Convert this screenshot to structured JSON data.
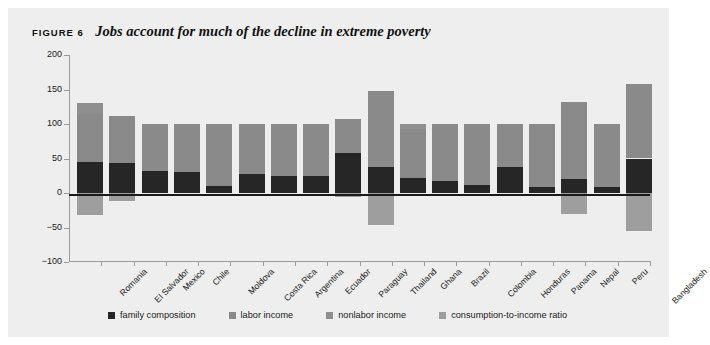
{
  "figure": {
    "label": "FIGURE 6",
    "caption": "Jobs account for much of the decline in extreme poverty"
  },
  "colors": {
    "panel_background": "#eeeeee",
    "family_composition": "#262626",
    "labor_income": "#7f7f7f",
    "nonlabor_income": "#8c8c8c",
    "consumption_to_income_ratio": "#a6a6a6",
    "axis": "#9a9a9a",
    "zero_line": "#1a1a1a"
  },
  "legend": {
    "position": "bottom",
    "items": [
      {
        "label": "family composition",
        "color": "#262626"
      },
      {
        "label": "labor income",
        "color": "#8a8a8a"
      },
      {
        "label": "nonlabor income",
        "color": "#8f8f8f"
      },
      {
        "label": "consumption-to-income ratio",
        "color": "#9e9e9e"
      }
    ]
  },
  "chart_data": {
    "type": "bar",
    "subtype": "stacked-bar-with-negatives",
    "title": "Jobs account for much of the decline in extreme poverty",
    "subtitle": "",
    "xlabel": "",
    "ylabel": "percentage of total change in extreme poverty",
    "ylim": [
      -100,
      200
    ],
    "yticks": [
      -100,
      -50,
      0,
      50,
      100,
      150,
      200
    ],
    "ytick_labels": [
      "−100",
      "−50",
      "0",
      "50",
      "100",
      "150",
      "200"
    ],
    "grid": false,
    "zero_reference_line": 0,
    "categories": [
      "Romania",
      "El Salvador",
      "Mexico",
      "Chile",
      "Moldova",
      "Costa Rica",
      "Argentina",
      "Ecuador",
      "Paraguay",
      "Thailand",
      "Ghana",
      "Brazil",
      "Colombia",
      "Honduras",
      "Panama",
      "Nepal",
      "Peru",
      "Bangladesh"
    ],
    "series": [
      {
        "name": "family composition",
        "color": "#262626",
        "values": [
          45,
          44,
          32,
          30,
          10,
          27,
          25,
          24,
          58,
          37,
          22,
          17,
          11,
          38,
          8,
          20,
          8,
          50
        ]
      },
      {
        "name": "labor income",
        "color": "#8a8a8a",
        "values": [
          70,
          67,
          68,
          70,
          90,
          73,
          75,
          76,
          49,
          111,
          71,
          83,
          89,
          62,
          92,
          112,
          92,
          108
        ]
      },
      {
        "name": "nonlabor income",
        "color": "#8f8f8f",
        "values": [
          15,
          0,
          0,
          0,
          0,
          0,
          0,
          0,
          0,
          0,
          7,
          0,
          0,
          0,
          0,
          0,
          0,
          0
        ]
      },
      {
        "name": "consumption-to-income ratio",
        "color": "#9e9e9e",
        "values": [
          -32,
          -11,
          0,
          0,
          0,
          0,
          0,
          0,
          -6,
          -47,
          0,
          0,
          0,
          0,
          0,
          -30,
          0,
          -55
        ]
      }
    ],
    "bar_totals_positive": [
      130,
      111,
      100,
      100,
      100,
      100,
      100,
      100,
      107,
      148,
      100,
      100,
      100,
      100,
      100,
      132,
      100,
      158
    ],
    "bar_totals_negative": [
      -32,
      -11,
      0,
      0,
      0,
      0,
      0,
      0,
      -6,
      -47,
      0,
      0,
      0,
      0,
      0,
      -30,
      0,
      -55
    ]
  }
}
